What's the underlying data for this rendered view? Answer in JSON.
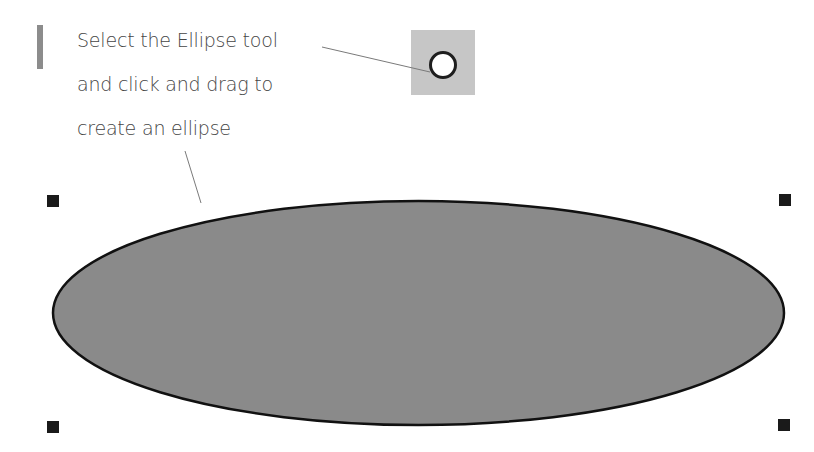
{
  "callout": {
    "lines": [
      "Select the Ellipse tool",
      "and click and drag to",
      "create an ellipse"
    ]
  },
  "tool": {
    "name": "Ellipse tool",
    "icon": "ellipse-tool-icon",
    "box_color": "#c6c6c6"
  },
  "ellipse": {
    "cx": 418.5,
    "cy": 313,
    "rx": 365.5,
    "ry": 112,
    "fill": "#8a8a8a",
    "stroke": "#111111"
  },
  "selection_handles": [
    {
      "position": "top-left",
      "x": 47,
      "y": 195
    },
    {
      "position": "top-right",
      "x": 779,
      "y": 194
    },
    {
      "position": "bottom-left",
      "x": 47,
      "y": 421
    },
    {
      "position": "bottom-right",
      "x": 778,
      "y": 419
    }
  ],
  "colors": {
    "text": "#454545",
    "accent_bar": "#8c8c8c",
    "leader_line": "#7a7a7a",
    "handle": "#1a1a1a"
  }
}
